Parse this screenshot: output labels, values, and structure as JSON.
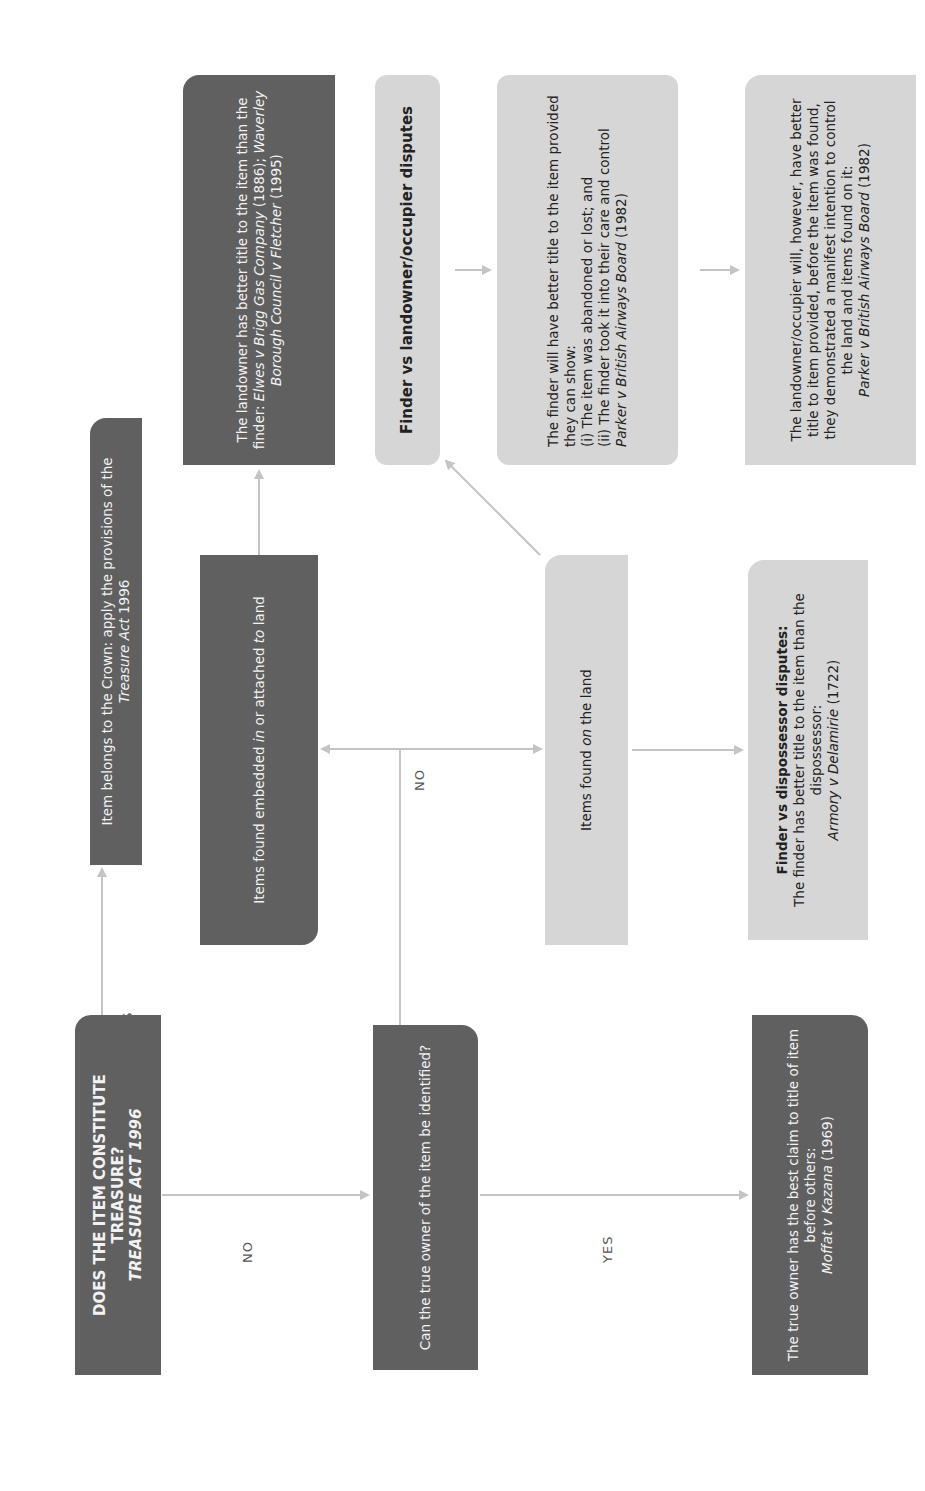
{
  "diagram": {
    "orientation": "rotated-90-ccw",
    "colors": {
      "dark_box": "#606060",
      "light_box": "#d6d6d6",
      "arrow": "#c4c4c4",
      "label_text": "#555555"
    },
    "nodes": {
      "treasure_question": {
        "line1": "DOES THE ITEM CONSTITUTE",
        "line2": "TREASURE?",
        "line3": "TREASURE ACT 1996"
      },
      "crown": {
        "text1": "Item belongs to the Crown: apply the provisions of the ",
        "text_italic": "Treasure Act",
        "text2": " 1996"
      },
      "true_owner_question": {
        "text": "Can the true owner of the item be identified?"
      },
      "true_owner_result": {
        "text": "The true owner has the best claim to title of item before others:",
        "case_italic": "Moffat v Kazana",
        "case_year": " (1969)"
      },
      "embedded": {
        "text1": "Items found embedded ",
        "italic1": "in",
        "text2": " or attached ",
        "italic2": "to",
        "text3": " land"
      },
      "on_land": {
        "text1": "Items found ",
        "italic1": "on",
        "text2": " the land"
      },
      "dispossessor": {
        "heading": "Finder vs dispossessor disputes:",
        "text": "The finder has better title to the item than the dispossessor:",
        "case_italic": "Armory v Delamirie",
        "case_year": " (1722)"
      },
      "landowner_better": {
        "text": "The landowner has better title to the item than the finder: ",
        "case1_italic": "Elwes v Brigg Gas Company",
        "case1_year": " (1886); ",
        "case2_italic": "Waverley Borough Council v Fletcher",
        "case2_year": " (1995)"
      },
      "finder_vs_landowner": {
        "heading": "Finder vs landowner/occupier disputes"
      },
      "finder_better": {
        "intro": "The finder will have better title to the item provided they can show:",
        "point1": "(i)  The item was abandoned or lost; and",
        "point2": "(ii) The finder took it into their care and control",
        "case_italic": "Parker v British Airways Board",
        "case_year": " (1982)"
      },
      "landowner_occupier": {
        "text": "The landowner/occupier will, however, have better title to item provided, before the item was found, they demonstrated a manifest intention to control the land and items found on it:",
        "case_italic": "Parker v British Airways Board",
        "case_year": " (1982)"
      }
    },
    "edge_labels": {
      "treasure_yes": "YES",
      "treasure_no": "NO",
      "owner_no": "NO",
      "owner_yes": "YES"
    }
  }
}
